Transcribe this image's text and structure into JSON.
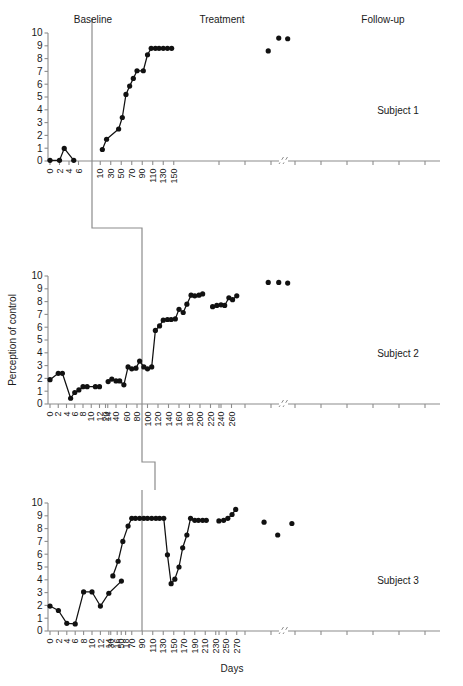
{
  "figure": {
    "y_axis_title": "Perception of control",
    "x_axis_title": "Days",
    "y_ticks": [
      0,
      1,
      2,
      3,
      4,
      5,
      6,
      7,
      8,
      9,
      10
    ],
    "ylim": [
      0,
      10
    ],
    "phase_labels": {
      "baseline": "Baseline",
      "treatment": "Treatment",
      "followup": "Follow-up"
    },
    "axis_break_marker": "//"
  },
  "chart_data": [
    {
      "type": "scatter",
      "title": "Subject 1",
      "subject_label": "Subject 1",
      "ylabel": "Perception of control",
      "xlabel": "Days",
      "ylim": [
        0,
        10
      ],
      "grid": false,
      "legend": "none",
      "baseline_ticks": [
        0,
        2,
        4,
        6
      ],
      "treatment_ticks": [
        10,
        30,
        50,
        70,
        90,
        110,
        130,
        150
      ],
      "phase_change_day": 8,
      "series": [
        {
          "name": "baseline",
          "x": [
            0,
            2,
            3,
            5
          ],
          "values": [
            0.05,
            0.05,
            0.98,
            0.05
          ]
        },
        {
          "name": "treatment",
          "x": [
            14,
            22,
            45,
            52,
            59,
            66,
            73,
            80,
            92,
            100,
            107,
            115,
            122,
            130,
            138,
            146
          ],
          "values": [
            0.9,
            1.7,
            2.5,
            3.4,
            5.2,
            5.85,
            6.45,
            7.05,
            7.05,
            8.3,
            8.8,
            8.8,
            8.8,
            8.8,
            8.8,
            8.8
          ]
        },
        {
          "name": "follow-up",
          "x": [
            330,
            350,
            367
          ],
          "values": [
            8.6,
            9.6,
            9.55
          ]
        }
      ]
    },
    {
      "type": "scatter",
      "title": "Subject 2",
      "subject_label": "Subject 2",
      "ylabel": "Perception of control",
      "xlabel": "Days",
      "ylim": [
        0,
        10
      ],
      "grid": false,
      "legend": "none",
      "baseline_ticks": [
        0,
        2,
        4,
        6,
        8,
        10,
        12,
        14
      ],
      "treatment_ticks": [
        20,
        40,
        60,
        80,
        100,
        120,
        140,
        160,
        180,
        200,
        220,
        240,
        260
      ],
      "phase_change_day": 16,
      "series": [
        {
          "name": "baseline",
          "x": [
            0,
            2,
            3,
            5,
            6,
            7,
            8,
            9,
            11,
            12
          ],
          "values": [
            1.9,
            2.4,
            2.4,
            0.45,
            0.9,
            1.1,
            1.35,
            1.35,
            1.35,
            1.35
          ]
        },
        {
          "name": "treatment",
          "x": [
            25,
            32,
            40,
            47,
            55,
            63,
            70,
            78,
            85,
            93,
            100,
            108,
            115,
            123,
            130,
            138,
            145,
            153,
            160,
            168,
            175,
            183,
            190,
            198,
            205
          ],
          "values": [
            1.75,
            1.95,
            1.8,
            1.8,
            1.5,
            2.9,
            2.75,
            2.8,
            3.35,
            2.9,
            2.75,
            2.9,
            5.75,
            6.1,
            6.55,
            6.6,
            6.6,
            6.65,
            7.4,
            7.15,
            7.8,
            8.5,
            8.45,
            8.5,
            8.6
          ]
        },
        {
          "name": "treatment-2",
          "x": [
            224,
            232,
            240,
            247,
            255,
            262,
            270
          ],
          "values": [
            7.6,
            7.7,
            7.75,
            7.7,
            8.3,
            8.15,
            8.45
          ]
        },
        {
          "name": "follow-up",
          "x": [
            330,
            350,
            367
          ],
          "values": [
            9.5,
            9.5,
            9.45
          ]
        }
      ]
    },
    {
      "type": "scatter",
      "title": "Subject 3",
      "subject_label": "Subject 3",
      "ylabel": "Perception of control",
      "xlabel": "Days",
      "ylim": [
        0,
        10
      ],
      "grid": false,
      "legend": "none",
      "baseline_ticks": [
        0,
        2,
        4,
        6,
        8,
        10,
        12,
        14,
        16,
        18
      ],
      "treatment_ticks": [
        30,
        50,
        70,
        90,
        110,
        130,
        150,
        170,
        190,
        210,
        230,
        250,
        270
      ],
      "phase_change_day": 22,
      "series": [
        {
          "name": "baseline",
          "x": [
            0,
            2,
            4,
            6,
            8,
            10,
            12,
            14,
            17
          ],
          "values": [
            1.95,
            1.6,
            0.6,
            0.55,
            3.05,
            3.05,
            1.95,
            2.95,
            3.9
          ]
        },
        {
          "name": "treatment",
          "x": [
            34,
            44,
            53,
            63,
            70,
            77,
            85,
            93,
            100,
            108,
            116,
            123,
            131,
            138,
            145,
            152,
            160,
            167,
            175,
            182,
            190,
            197,
            205,
            212
          ],
          "values": [
            4.3,
            5.45,
            7.0,
            8.2,
            8.8,
            8.8,
            8.8,
            8.8,
            8.8,
            8.8,
            8.8,
            8.8,
            8.8,
            5.95,
            3.7,
            4.05,
            5.0,
            6.5,
            7.5,
            8.8,
            8.65,
            8.65,
            8.65,
            8.65
          ]
        },
        {
          "name": "treatment-2",
          "x": [
            236,
            245,
            253,
            261,
            268
          ],
          "values": [
            8.6,
            8.65,
            8.8,
            9.1,
            9.5
          ]
        },
        {
          "name": "follow-up",
          "x": [
            322,
            348,
            375
          ],
          "values": [
            8.5,
            7.5,
            8.4
          ]
        }
      ]
    }
  ]
}
